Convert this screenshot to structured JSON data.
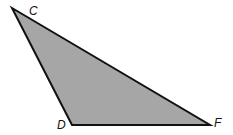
{
  "diagram": {
    "type": "triangle",
    "fill": "#a6a6a6",
    "stroke": "#111111",
    "vertices": [
      {
        "name": "C",
        "x": 12,
        "y": 8,
        "label_x": 29,
        "label_y": 15
      },
      {
        "name": "D",
        "x": 72,
        "y": 125,
        "label_x": 57,
        "label_y": 129
      },
      {
        "name": "F",
        "x": 210,
        "y": 125,
        "label_x": 214,
        "label_y": 127
      }
    ],
    "labels": {
      "c": "C",
      "d": "D",
      "f": "F"
    }
  }
}
